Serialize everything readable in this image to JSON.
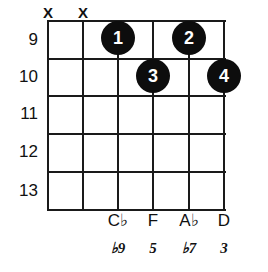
{
  "diagram": {
    "type": "guitar-chord-diagram",
    "strings_count": 6,
    "frets_count": 5,
    "fret_numbers": [
      "9",
      "10",
      "11",
      "12",
      "13"
    ],
    "string_markers": [
      "X",
      "X",
      "",
      "",
      "",
      ""
    ],
    "mute_symbol": "X",
    "finger_dots": [
      {
        "label": "1",
        "string": 3,
        "fret_index": 0
      },
      {
        "label": "2",
        "string": 5,
        "fret_index": 0
      },
      {
        "label": "3",
        "string": 4,
        "fret_index": 1
      },
      {
        "label": "4",
        "string": 6,
        "fret_index": 1
      }
    ],
    "note_names": [
      "",
      "",
      "C♭",
      "F",
      "A♭",
      "D"
    ],
    "intervals": [
      "",
      "",
      "♭9",
      "5",
      "♭7",
      "3"
    ],
    "colors": {
      "line": "#1a1a1a",
      "dot_fill": "#0d0d0d",
      "dot_text": "#ffffff",
      "text": "#111111",
      "background": "#ffffff"
    }
  }
}
